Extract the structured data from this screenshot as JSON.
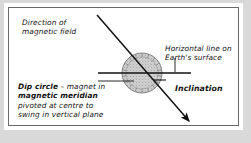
{
  "figure": {
    "domain": "physics-diagram",
    "background_color": "#d9d9d9",
    "paper_color": "#ffffff",
    "border_color": "#6a6a6a",
    "ink_color": "#121212",
    "disc_fill": "#c9c9c9"
  },
  "labels": {
    "field_line1": "Direction of",
    "field_line2": "magnetic field",
    "horizontal_line1": "Horizontal line on",
    "horizontal_line2": "Earth's surface",
    "dip_bold1": "Dip circle",
    "dip_dash": " – magnet in",
    "dip_bold2": "magnetic meridian",
    "dip_line3": "pivoted at centre to",
    "dip_line4": "swing in vertical plane",
    "inclination": "Inclination"
  },
  "geometry": {
    "disc_center_x": 141,
    "disc_center_y": 72,
    "disc_radius": 20,
    "field_arrow_start": [
      96,
      14
    ],
    "field_arrow_end": [
      190,
      122
    ],
    "horizontal_line_start": [
      97,
      72
    ],
    "horizontal_line_end": [
      190,
      72
    ],
    "horizontal_tick_x": 174,
    "horizontal_tick_top": 58,
    "dip_leader_start": [
      98,
      80
    ],
    "dip_leader_end": [
      133,
      80
    ],
    "inclination_leader_start": [
      153,
      79
    ],
    "inclination_leader_end": [
      165,
      79
    ]
  }
}
